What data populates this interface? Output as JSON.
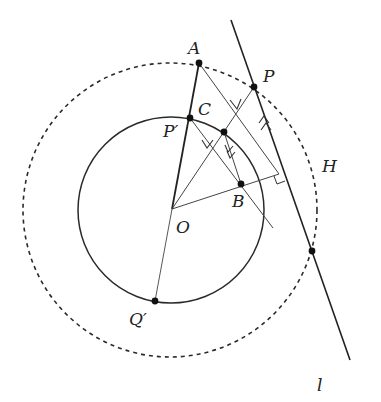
{
  "diagram": {
    "type": "geometry-inversion",
    "colors": {
      "stroke": "#2a2a2a",
      "thin": "#444444",
      "background": "#ffffff"
    },
    "circles": {
      "inner": {
        "cx": 171,
        "cy": 210,
        "r": 93,
        "style": "solid"
      },
      "outer": {
        "cx": 170,
        "cy": 210,
        "r": 147,
        "style": "dashed",
        "label": "H"
      }
    },
    "points": {
      "A": {
        "label": "A",
        "x": 199,
        "y": 63
      },
      "P": {
        "label": "P",
        "x": 254,
        "y": 87
      },
      "C": {
        "label": "C",
        "x": 224,
        "y": 132
      },
      "Pp": {
        "label": "P′",
        "x": 190,
        "y": 118
      },
      "B": {
        "label": "B",
        "x": 241,
        "y": 184
      },
      "O": {
        "label": "O",
        "x": 172,
        "y": 209
      },
      "Qp": {
        "label": "Q′",
        "x": 155,
        "y": 301
      },
      "X": {
        "label": "",
        "x": 312,
        "y": 251
      }
    },
    "line_l": {
      "label": "l"
    },
    "labels": {
      "A": "A",
      "P": "P",
      "C": "C",
      "Pp": "P′",
      "B": "B",
      "O": "O",
      "Qp": "Q′",
      "H": "H",
      "l": "l"
    }
  }
}
